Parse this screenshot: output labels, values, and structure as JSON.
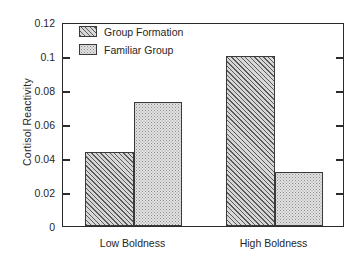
{
  "chart_data": {
    "type": "bar",
    "title": "",
    "xlabel": "",
    "ylabel": "Cortisol Reactivity",
    "categories": [
      "Low Boldness",
      "High Boldness"
    ],
    "series": [
      {
        "name": "Group Formation",
        "values": [
          0.0434,
          0.1
        ],
        "pattern": "diagonal-hatch"
      },
      {
        "name": "Familiar Group",
        "values": [
          0.073,
          0.032
        ],
        "pattern": "stipple"
      }
    ],
    "ylim": [
      0,
      0.12
    ],
    "ytick_values": [
      0,
      0.02,
      0.04,
      0.06,
      0.08,
      0.1,
      0.12
    ],
    "ytick_labels": [
      "0",
      "0.02",
      "0.04",
      "0.06",
      "0.08",
      "0.1",
      "0.12"
    ],
    "grid": false,
    "legend_position": "top-left",
    "colors": {
      "axis": "#2b2b2b",
      "bar_edge": "#3a3a3a",
      "group_formation_fill": "#d7d7d7",
      "familiar_group_fill": "#e2e2e2",
      "background": "#ffffff"
    }
  },
  "legend": {
    "items": [
      {
        "label": "Group Formation",
        "pattern": "diagonal-hatch"
      },
      {
        "label": "Familiar Group",
        "pattern": "stipple"
      }
    ]
  }
}
